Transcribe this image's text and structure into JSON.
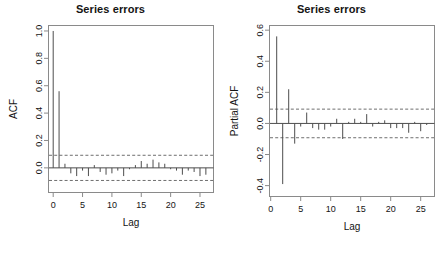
{
  "figure": {
    "background": "#ffffff",
    "axis_color": "#8a8a8a",
    "bar_color": "#4d4d4d",
    "conf_color": "#6e6e6e",
    "text_color": "#141414"
  },
  "chart_data": [
    {
      "type": "bar",
      "panel": "left",
      "title": "Series errors",
      "xlabel": "Lag",
      "ylabel": "ACF",
      "xlim": [
        -0.8,
        27.3
      ],
      "ylim": [
        -0.18,
        1.04
      ],
      "xticks": [
        0,
        5,
        10,
        15,
        20,
        25
      ],
      "xticklabels": [
        "0",
        "5",
        "10",
        "15",
        "20",
        "25"
      ],
      "yticks": [
        0.0,
        0.2,
        0.4,
        0.6,
        0.8,
        1.0
      ],
      "yticklabels": [
        "0.0",
        "0.2",
        "0.4",
        "0.6",
        "0.8",
        "1.0"
      ],
      "grid": false,
      "legend": "none",
      "confidence_bands": [
        0.092,
        -0.092
      ],
      "confidence_style": "dashed",
      "zero_line": 0.0,
      "x": [
        0,
        1,
        2,
        3,
        4,
        5,
        6,
        7,
        8,
        9,
        10,
        11,
        12,
        13,
        14,
        15,
        16,
        17,
        18,
        19,
        20,
        21,
        22,
        23,
        24,
        25,
        26
      ],
      "values": [
        1.0,
        0.56,
        0.03,
        -0.04,
        -0.06,
        -0.02,
        -0.06,
        0.02,
        -0.03,
        -0.05,
        -0.04,
        -0.02,
        -0.06,
        -0.01,
        0.02,
        0.05,
        0.03,
        0.06,
        0.04,
        0.03,
        -0.01,
        -0.02,
        -0.05,
        -0.02,
        -0.03,
        -0.06,
        -0.05
      ]
    },
    {
      "type": "bar",
      "panel": "right",
      "title": "Series errors",
      "xlabel": "Lag",
      "ylabel": "Partial ACF",
      "xlim": [
        -0.2,
        27.3
      ],
      "ylim": [
        -0.47,
        0.63
      ],
      "xticks": [
        0,
        5,
        10,
        15,
        20,
        25
      ],
      "xticklabels": [
        "0",
        "5",
        "10",
        "15",
        "20",
        "25"
      ],
      "yticks": [
        -0.4,
        -0.2,
        0.0,
        0.2,
        0.4,
        0.6
      ],
      "yticklabels": [
        "-0.4",
        "-0.2",
        "0.0",
        "0.2",
        "0.4",
        "0.6"
      ],
      "grid": false,
      "legend": "none",
      "confidence_bands": [
        0.092,
        -0.092
      ],
      "confidence_style": "dashed",
      "zero_line": 0.0,
      "x": [
        1,
        2,
        3,
        4,
        5,
        6,
        7,
        8,
        9,
        10,
        11,
        12,
        13,
        14,
        15,
        16,
        17,
        18,
        19,
        20,
        21,
        22,
        23,
        24,
        25,
        26
      ],
      "values": [
        0.56,
        -0.39,
        0.22,
        -0.13,
        -0.02,
        0.07,
        -0.03,
        -0.04,
        -0.04,
        -0.02,
        0.03,
        -0.1,
        0.01,
        0.03,
        0.01,
        0.06,
        -0.02,
        0.01,
        0.02,
        -0.03,
        -0.03,
        -0.03,
        -0.06,
        0.01,
        -0.05,
        -0.01
      ]
    }
  ]
}
